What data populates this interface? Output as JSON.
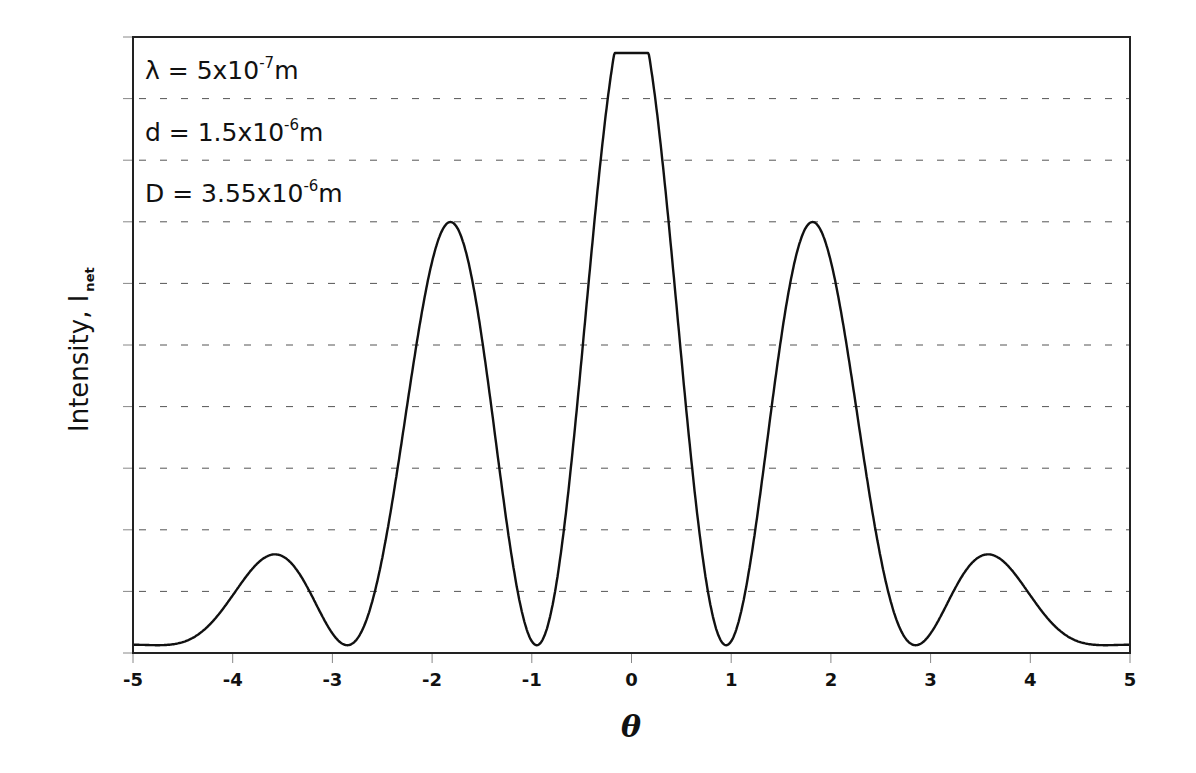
{
  "chart_data": {
    "type": "line",
    "title": "",
    "xlabel": "θ",
    "ylabel": "Intensity, I",
    "ylabel_subscript": "net",
    "xlim": [
      -5,
      5
    ],
    "ylim": [
      0,
      1
    ],
    "x_ticks": [
      -5,
      -4,
      -3,
      -2,
      -1,
      0,
      1,
      2,
      3,
      4,
      5
    ],
    "x_tick_labels": [
      "-5",
      "-4",
      "-3",
      "-2",
      "-1",
      "0",
      "1",
      "2",
      "3",
      "4",
      "5"
    ],
    "y_tick_labels": [],
    "y_gridlines": 10,
    "grid": "horizontal dashed",
    "legend": null,
    "series": [
      {
        "name": "I_net",
        "color": "#111111",
        "note": "double-slit interference modulated by single-slit diffraction envelope; central peak clipped at top of plot",
        "peaks": [
          {
            "x": -3.72,
            "y": 0.46
          },
          {
            "x": -1.9,
            "y": 0.836
          },
          {
            "x": 0.0,
            "y": 1.0,
            "clipped_at": 0.974
          },
          {
            "x": 1.9,
            "y": 0.836
          },
          {
            "x": 3.72,
            "y": 0.46
          }
        ],
        "minima": [
          {
            "x": -4.75,
            "y": 0.01
          },
          {
            "x": -2.85,
            "y": 0.015
          },
          {
            "x": -0.97,
            "y": 0.01
          },
          {
            "x": 0.97,
            "y": 0.01
          },
          {
            "x": 2.85,
            "y": 0.015
          },
          {
            "x": 4.75,
            "y": 0.01
          }
        ],
        "endpoints": [
          {
            "x": -5,
            "y": 0.04
          },
          {
            "x": 5,
            "y": 0.04
          }
        ]
      }
    ],
    "annotations": [
      {
        "label": "λ = 5x10",
        "exp": "-7",
        "unit": "m"
      },
      {
        "label": "d = 1.5x10",
        "exp": "-6",
        "unit": "m"
      },
      {
        "label": "D = 3.55x10",
        "exp": "-6",
        "unit": "m"
      }
    ]
  },
  "plot": {
    "left": 133,
    "right": 1130,
    "top": 37,
    "bottom": 653,
    "clip_top_y": 53,
    "fringe_period": 1.9,
    "envelope_width": 5.3,
    "base": 0.012
  }
}
